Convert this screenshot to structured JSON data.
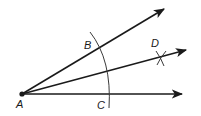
{
  "diagram": {
    "colors": {
      "stroke": "#1a1a1a",
      "arc": "#3a3a3a",
      "background": "#ffffff"
    },
    "labels": {
      "vertex": "A",
      "point_b": "B",
      "point_c": "C",
      "point_d": "D"
    },
    "points": {
      "A": [
        22,
        94
      ],
      "B": [
        101,
        45
      ],
      "C": [
        111,
        94
      ],
      "D": [
        161,
        58
      ]
    },
    "rays": [
      {
        "name": "ray-AB",
        "from": [
          22,
          94
        ],
        "to": [
          166,
          8
        ]
      },
      {
        "name": "ray-AD",
        "from": [
          22,
          94
        ],
        "to": [
          188,
          50
        ]
      },
      {
        "name": "ray-AC",
        "from": [
          22,
          94
        ],
        "to": [
          184,
          94
        ]
      }
    ]
  }
}
